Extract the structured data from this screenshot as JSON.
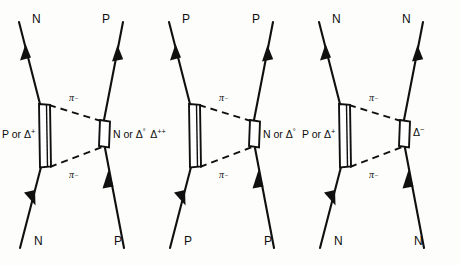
{
  "figure": {
    "background_color": "#fdfdfc",
    "ink_color": "#101010",
    "diagram_count": 3
  },
  "diagrams": [
    {
      "id": "diagram-1",
      "legs": {
        "top_left": "N",
        "top_right": "P",
        "bottom_left": "N",
        "bottom_right": "P"
      },
      "left_blob": {
        "text": "P or Δ",
        "superscript": "+",
        "full": "P or Δ⁺",
        "shape": "tall-rectangle"
      },
      "right_blob": {
        "text": "N or Δ",
        "superscript": "°",
        "full": "N or Δ°",
        "shape": "small-rectangle"
      },
      "exchange": {
        "top_label": "π",
        "top_superscript": "−",
        "bottom_label": "π",
        "bottom_superscript": "−",
        "style": "dashed"
      }
    },
    {
      "id": "diagram-2",
      "legs": {
        "top_left": "P",
        "top_right": "P",
        "bottom_left": "P",
        "bottom_right": "P"
      },
      "left_blob": {
        "text": "Δ",
        "superscript": "++",
        "full": "Δ⁺⁺",
        "shape": "tall-rectangle"
      },
      "right_blob": {
        "text": "N or Δ",
        "superscript": "°",
        "full": "N or Δ°",
        "shape": "small-rectangle"
      },
      "exchange": {
        "top_label": "π",
        "top_superscript": "−",
        "bottom_label": "π",
        "bottom_superscript": "−",
        "style": "dashed"
      }
    },
    {
      "id": "diagram-3",
      "legs": {
        "top_left": "N",
        "top_right": "N",
        "bottom_left": "N",
        "bottom_right": "N"
      },
      "left_blob": {
        "text": "P or Δ",
        "superscript": "+",
        "full": "P or Δ⁺",
        "shape": "tall-rectangle"
      },
      "right_blob": {
        "text": "Δ",
        "superscript": "−",
        "full": "Δ⁻",
        "shape": "small-rectangle"
      },
      "exchange": {
        "top_label": "π",
        "top_superscript": "−",
        "bottom_label": "π",
        "bottom_superscript": "−",
        "style": "dashed"
      }
    }
  ]
}
